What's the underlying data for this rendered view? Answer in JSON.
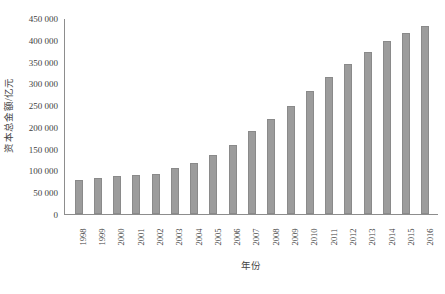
{
  "chart_data": {
    "type": "bar",
    "title": "",
    "xlabel": "年份",
    "ylabel": "资本总金额/亿元",
    "categories": [
      "1998",
      "1999",
      "2000",
      "2001",
      "2002",
      "2003",
      "2004",
      "2005",
      "2006",
      "2007",
      "2008",
      "2009",
      "2010",
      "2011",
      "2012",
      "2013",
      "2014",
      "2015",
      "2016"
    ],
    "values": [
      78000,
      83000,
      88000,
      90000,
      93000,
      105000,
      117000,
      135000,
      158000,
      190000,
      218000,
      248000,
      283000,
      315000,
      345000,
      372000,
      398000,
      415000,
      432000
    ],
    "ylim": [
      0,
      450000
    ],
    "ytick_values": [
      0,
      50000,
      100000,
      150000,
      200000,
      250000,
      300000,
      350000,
      400000,
      450000
    ],
    "ytick_labels": [
      "0",
      "50 000",
      "100 000",
      "150 000",
      "200 000",
      "250 000",
      "300 000",
      "350 000",
      "400 000",
      "450 000"
    ],
    "grid": false,
    "legend": "none",
    "series_color": "#9c9c9c"
  },
  "figure": {
    "caption": ""
  }
}
